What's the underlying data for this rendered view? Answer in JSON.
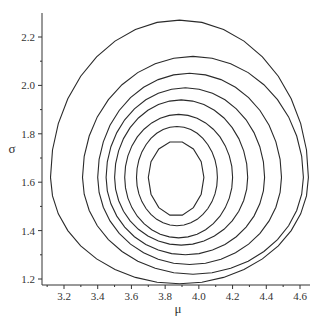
{
  "chart_data": {
    "type": "contour",
    "title": "",
    "xlabel": "μ",
    "ylabel": "σ",
    "xlim": [
      3.1,
      4.65
    ],
    "ylim": [
      1.17,
      2.3
    ],
    "x_ticks": [
      3.2,
      3.4,
      3.6,
      3.8,
      4.0,
      4.2,
      4.4,
      4.6
    ],
    "x_tick_labels": [
      "3.2",
      "3.4",
      "3.6",
      "3.8",
      "4.0",
      "4.2",
      "4.4",
      "4.6"
    ],
    "y_ticks": [
      1.2,
      1.4,
      1.6,
      1.8,
      2.0,
      2.2
    ],
    "y_tick_labels": [
      "1.2",
      "1.4",
      "1.6",
      "1.8",
      "2.0",
      "2.2"
    ],
    "grid": false,
    "legend": null,
    "center": {
      "mu": 3.87,
      "sigma": 1.62
    },
    "contours": [
      {
        "level": 1,
        "mu_range": [
          3.7,
          4.03
        ],
        "sigma_range": [
          1.46,
          1.77
        ]
      },
      {
        "level": 2,
        "mu_range": [
          3.63,
          4.11
        ],
        "sigma_range": [
          1.42,
          1.83
        ]
      },
      {
        "level": 3,
        "mu_range": [
          3.56,
          4.2
        ],
        "sigma_range": [
          1.37,
          1.88
        ]
      },
      {
        "level": 4,
        "mu_range": [
          3.5,
          4.29
        ],
        "sigma_range": [
          1.34,
          1.94
        ]
      },
      {
        "level": 5,
        "mu_range": [
          3.45,
          4.39
        ],
        "sigma_range": [
          1.3,
          1.99
        ]
      },
      {
        "level": 6,
        "mu_range": [
          3.4,
          4.49
        ],
        "sigma_range": [
          1.26,
          2.05
        ]
      },
      {
        "level": 7,
        "mu_range": [
          3.31,
          4.62
        ],
        "sigma_range": [
          1.22,
          2.12
        ]
      },
      {
        "level": 8,
        "mu_range": [
          3.12,
          4.65
        ],
        "sigma_range": [
          1.18,
          2.27
        ]
      }
    ]
  }
}
